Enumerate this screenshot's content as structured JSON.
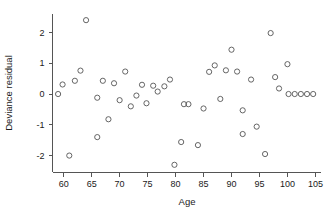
{
  "chart_data": {
    "type": "scatter",
    "title": "",
    "xlabel": "Age",
    "ylabel": "Deviance residual",
    "xlim": [
      58,
      106
    ],
    "ylim": [
      -2.55,
      2.6
    ],
    "xticks": [
      60,
      65,
      70,
      75,
      80,
      85,
      90,
      95,
      100,
      105
    ],
    "yticks": [
      2,
      1,
      0,
      -1,
      -2
    ],
    "grid": false,
    "legend": null,
    "marker": "open-circle",
    "marker_color": "#555555",
    "axis_color": "#555555",
    "points": [
      {
        "x": 59,
        "y": 0.0
      },
      {
        "x": 59.8,
        "y": 0.31
      },
      {
        "x": 61,
        "y": -2.0
      },
      {
        "x": 62,
        "y": 0.43
      },
      {
        "x": 63,
        "y": 0.76
      },
      {
        "x": 64,
        "y": 2.4
      },
      {
        "x": 66,
        "y": -0.12
      },
      {
        "x": 66,
        "y": -1.4
      },
      {
        "x": 67,
        "y": 0.43
      },
      {
        "x": 68,
        "y": -0.82
      },
      {
        "x": 69,
        "y": 0.35
      },
      {
        "x": 70,
        "y": -0.2
      },
      {
        "x": 71,
        "y": 0.73
      },
      {
        "x": 72,
        "y": -0.4
      },
      {
        "x": 73,
        "y": -0.05
      },
      {
        "x": 74,
        "y": 0.3
      },
      {
        "x": 74.8,
        "y": -0.3
      },
      {
        "x": 76,
        "y": 0.27
      },
      {
        "x": 76.8,
        "y": 0.08
      },
      {
        "x": 78,
        "y": 0.25
      },
      {
        "x": 79,
        "y": 0.47
      },
      {
        "x": 79.8,
        "y": -2.3
      },
      {
        "x": 81,
        "y": -1.56
      },
      {
        "x": 81.5,
        "y": -0.33
      },
      {
        "x": 82.3,
        "y": -0.33
      },
      {
        "x": 84,
        "y": -1.66
      },
      {
        "x": 85,
        "y": -0.47
      },
      {
        "x": 86,
        "y": 0.72
      },
      {
        "x": 87,
        "y": 0.93
      },
      {
        "x": 88,
        "y": -0.16
      },
      {
        "x": 89,
        "y": 0.77
      },
      {
        "x": 90,
        "y": 1.44
      },
      {
        "x": 91,
        "y": 0.73
      },
      {
        "x": 92,
        "y": -0.53
      },
      {
        "x": 92,
        "y": -1.3
      },
      {
        "x": 93.5,
        "y": 0.47
      },
      {
        "x": 94.5,
        "y": -1.06
      },
      {
        "x": 96,
        "y": -1.95
      },
      {
        "x": 97,
        "y": 1.98
      },
      {
        "x": 97.8,
        "y": 0.55
      },
      {
        "x": 98.5,
        "y": 0.18
      },
      {
        "x": 100,
        "y": 0.97
      },
      {
        "x": 100.2,
        "y": 0.0
      },
      {
        "x": 101.3,
        "y": 0.0
      },
      {
        "x": 102.4,
        "y": 0.0
      },
      {
        "x": 103.5,
        "y": 0.0
      },
      {
        "x": 104.6,
        "y": 0.0
      }
    ]
  },
  "figure": {
    "point_count_label": "48"
  }
}
